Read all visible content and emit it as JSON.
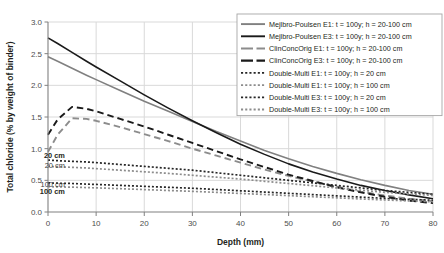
{
  "chart_data": {
    "type": "line",
    "title": "",
    "xlabel": "Depth (mm)",
    "ylabel": "Total chloride (% by weight of binder)",
    "xlim": [
      0,
      80
    ],
    "ylim": [
      0,
      3.0
    ],
    "xticks": [
      0,
      10,
      20,
      30,
      40,
      50,
      60,
      70,
      80
    ],
    "yticks": [
      "0.0",
      "0.5",
      "1.0",
      "1.5",
      "2.0",
      "2.5",
      "3.0"
    ],
    "grid": true,
    "legend_position": "top-right",
    "x": [
      0,
      2,
      5,
      8,
      10,
      15,
      20,
      25,
      30,
      35,
      40,
      45,
      50,
      55,
      60,
      65,
      70,
      75,
      80
    ],
    "series": [
      {
        "name": "Mejlbro-Poulsen E1: t = 100y; h = 20-100 cm",
        "style": "solid",
        "color": "#808080",
        "width": 1.6,
        "values": [
          2.45,
          2.38,
          2.27,
          2.16,
          2.09,
          1.92,
          1.75,
          1.59,
          1.43,
          1.27,
          1.12,
          0.97,
          0.84,
          0.72,
          0.61,
          0.51,
          0.42,
          0.34,
          0.28
        ]
      },
      {
        "name": "Mejlbro-Poulsen E3: t = 100y; h = 20-100 cm",
        "style": "solid",
        "color": "#1a1a1a",
        "width": 1.6,
        "values": [
          2.75,
          2.66,
          2.52,
          2.38,
          2.29,
          2.07,
          1.85,
          1.64,
          1.44,
          1.25,
          1.07,
          0.91,
          0.76,
          0.63,
          0.52,
          0.42,
          0.34,
          0.27,
          0.21
        ]
      },
      {
        "name": "ClinConcOrig E1: t = 100y; h = 20-100 cm",
        "style": "dashed",
        "color": "#8c8c8c",
        "width": 1.9,
        "values": [
          0.95,
          1.22,
          1.48,
          1.47,
          1.44,
          1.34,
          1.23,
          1.12,
          1.0,
          0.89,
          0.78,
          0.67,
          0.57,
          0.48,
          0.4,
          0.32,
          0.26,
          0.21,
          0.17
        ]
      },
      {
        "name": "ClinConcOrig E3: t = 100y; h = 20-100 cm",
        "style": "dashed",
        "color": "#1a1a1a",
        "width": 1.9,
        "values": [
          1.22,
          1.46,
          1.66,
          1.63,
          1.59,
          1.47,
          1.35,
          1.22,
          1.09,
          0.96,
          0.83,
          0.71,
          0.59,
          0.49,
          0.39,
          0.31,
          0.24,
          0.18,
          0.14
        ]
      },
      {
        "name": "Double-Multi E1: t = 100y; h = 20 cm",
        "style": "dotted",
        "color": "#262626",
        "width": 1.7,
        "values": [
          0.82,
          0.81,
          0.8,
          0.79,
          0.78,
          0.75,
          0.72,
          0.69,
          0.66,
          0.62,
          0.58,
          0.54,
          0.5,
          0.46,
          0.42,
          0.38,
          0.34,
          0.31,
          0.28
        ]
      },
      {
        "name": "Double-Multi E1: t = 100y; h = 100 cm",
        "style": "dotted",
        "color": "#8c8c8c",
        "width": 1.7,
        "values": [
          0.72,
          0.715,
          0.705,
          0.695,
          0.685,
          0.66,
          0.635,
          0.61,
          0.58,
          0.55,
          0.52,
          0.485,
          0.45,
          0.415,
          0.38,
          0.345,
          0.31,
          0.285,
          0.26
        ]
      },
      {
        "name": "Double-Multi E3: t = 100y; h = 20 cm",
        "style": "dotted",
        "color": "#262626",
        "width": 1.7,
        "values": [
          0.46,
          0.455,
          0.45,
          0.44,
          0.435,
          0.42,
          0.405,
          0.39,
          0.375,
          0.355,
          0.335,
          0.315,
          0.295,
          0.275,
          0.255,
          0.235,
          0.215,
          0.2,
          0.185
        ]
      },
      {
        "name": "Double-Multi E3: t = 100y; h = 100 cm",
        "style": "dotted",
        "color": "#8c8c8c",
        "width": 1.7,
        "values": [
          0.4,
          0.397,
          0.392,
          0.386,
          0.381,
          0.368,
          0.354,
          0.34,
          0.326,
          0.31,
          0.293,
          0.276,
          0.259,
          0.241,
          0.224,
          0.206,
          0.19,
          0.175,
          0.162
        ]
      }
    ],
    "annotations": [
      {
        "text": "20 cm",
        "x": 3.5,
        "y": 0.9,
        "bold": true,
        "anchor": "end"
      },
      {
        "text": "20 cm",
        "x": 3.5,
        "y": 0.735,
        "bold": false,
        "anchor": "end"
      },
      {
        "text": "100 cm",
        "x": 3.5,
        "y": 0.435,
        "bold": false,
        "anchor": "end"
      },
      {
        "text": "100 cm",
        "x": 3.5,
        "y": 0.33,
        "bold": true,
        "anchor": "end"
      }
    ]
  },
  "legend": {
    "items": [
      {
        "label": "Mejlbro-Poulsen E1: t = 100y; h = 20-100 cm",
        "style": "solid",
        "color": "#808080"
      },
      {
        "label": "Mejlbro-Poulsen E3: t = 100y; h = 20-100 cm",
        "style": "solid",
        "color": "#1a1a1a"
      },
      {
        "label": "ClinConcOrig E1: t = 100y; h = 20-100 cm",
        "style": "dashed",
        "color": "#8c8c8c"
      },
      {
        "label": "ClinConcOrig E3: t = 100y; h = 20-100 cm",
        "style": "dashed",
        "color": "#1a1a1a"
      },
      {
        "label": "Double-Multi E1: t = 100y; h = 20 cm",
        "style": "dotted",
        "color": "#262626"
      },
      {
        "label": "Double-Multi E1: t = 100y; h = 100 cm",
        "style": "dotted",
        "color": "#8c8c8c"
      },
      {
        "label": "Double-Multi E3: t = 100y; h = 20 cm",
        "style": "dotted",
        "color": "#262626"
      },
      {
        "label": "Double-Multi E3: t = 100y; h = 100 cm",
        "style": "dotted",
        "color": "#8c8c8c"
      }
    ]
  }
}
